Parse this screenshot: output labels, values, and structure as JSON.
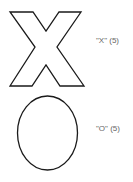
{
  "items": [
    {
      "shape": "x-outline",
      "label": "\"X\" (5)"
    },
    {
      "shape": "o-outline",
      "label": "\"O\" (5)"
    }
  ],
  "colors": {
    "stroke": "#1a1a1a",
    "label": "#666666"
  }
}
